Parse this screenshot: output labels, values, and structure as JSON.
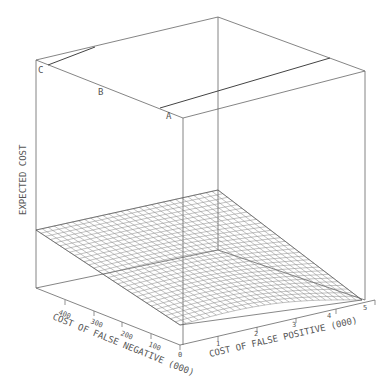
{
  "chart_data": {
    "type": "surface3d",
    "title": "",
    "zlabel": "EXPECTED COST",
    "xlabel": "COST OF FALSE POSITIVE (000)",
    "ylabel": "COST OF FALSE NEGATIVE (000)",
    "x_ticks": [
      "0",
      "1",
      "2",
      "3",
      "4",
      "5"
    ],
    "y_ticks": [
      "100",
      "200",
      "300",
      "400"
    ],
    "xlim": [
      0,
      5
    ],
    "ylim": [
      0,
      500
    ],
    "grid": true,
    "point_labels": [
      {
        "label": "A",
        "description": "front-top box corner"
      },
      {
        "label": "B",
        "description": "mid top-left edge"
      },
      {
        "label": "C",
        "description": "left-top box corner"
      }
    ],
    "surface": {
      "description": "Expected cost surface rising from front corner (0,0) toward back; low near origin, higher toward large false-negative and false-positive costs",
      "grid_lines_x": 30,
      "grid_lines_y": 30
    }
  },
  "labels": {
    "z_axis": "EXPECTED COST",
    "x_axis": "COST OF FALSE POSITIVE (000)",
    "y_axis": "COST OF FALSE NEGATIVE (000)",
    "point_a": "A",
    "point_b": "B",
    "point_c": "C",
    "x_tick_0": "0",
    "x_tick_1": "1",
    "x_tick_2": "2",
    "x_tick_3": "3",
    "x_tick_4": "4",
    "x_tick_5": "5",
    "y_tick_100": "100",
    "y_tick_200": "200",
    "y_tick_300": "300",
    "y_tick_400": "400"
  }
}
